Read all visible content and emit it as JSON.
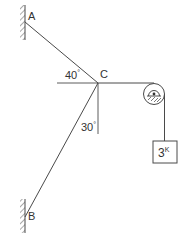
{
  "diagram": {
    "type": "statics-cable-system",
    "colors": {
      "stroke": "#4a4a4a",
      "text": "#333333",
      "background": "#ffffff"
    },
    "points": {
      "A": {
        "label": "A",
        "x": 25,
        "y": 22
      },
      "B": {
        "label": "B",
        "x": 25,
        "y": 217
      },
      "C": {
        "label": "C",
        "x": 98,
        "y": 83
      }
    },
    "angles": {
      "AC_from_horizontal": {
        "value": "40",
        "unit": "°"
      },
      "BC_from_vertical": {
        "value": "30",
        "unit": "°"
      }
    },
    "load": {
      "value": "3",
      "unit": "K"
    },
    "supports": [
      "wall-A",
      "wall-B",
      "pulley-support"
    ],
    "members": [
      "cable-AC",
      "cable-BC",
      "cable-C-pulley",
      "cable-pulley-load"
    ]
  }
}
